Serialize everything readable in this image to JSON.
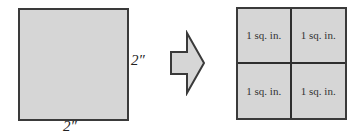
{
  "left_figure": {
    "shape": "square",
    "fill_color": "#d6d6d6",
    "border_color": "#3a3a3a",
    "side_label": "2″",
    "bottom_label": "2″"
  },
  "arrow": {
    "icon": "right-arrow-icon",
    "fill_color": "#d6d6d6"
  },
  "right_figure": {
    "shape": "2x2 grid",
    "cells": [
      {
        "label": "1 sq. in."
      },
      {
        "label": "1 sq. in."
      },
      {
        "label": "1 sq. in."
      },
      {
        "label": "1 sq. in."
      }
    ]
  }
}
